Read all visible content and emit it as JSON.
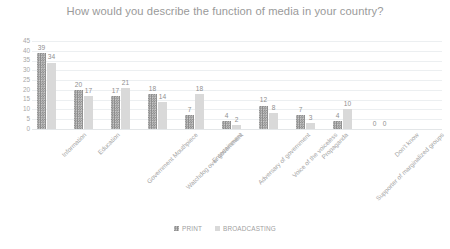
{
  "chart_data": {
    "type": "bar",
    "title": "How would you describe the function of media in your country?",
    "xlabel": "",
    "ylabel": "",
    "ylim": [
      0,
      45
    ],
    "yticks": [
      45,
      40,
      35,
      30,
      25,
      20,
      15,
      10,
      5,
      0
    ],
    "grid": true,
    "legend_position": "bottom",
    "categories": [
      "Information",
      "Education",
      "Government Mouthpiece",
      "Watchdog over government",
      "Entertainment",
      "Adversary of government",
      "Voice of the voiceless",
      "Propaganda",
      "Supporter of marginalized groups",
      "Don't know"
    ],
    "series": [
      {
        "name": "PRINT",
        "color": "#9d9d9d",
        "values": [
          39,
          20,
          17,
          18,
          7,
          4,
          12,
          7,
          4,
          0
        ]
      },
      {
        "name": "BROADCASTING",
        "color": "#d9d9d9",
        "values": [
          34,
          17,
          21,
          14,
          18,
          2,
          8,
          3,
          10,
          0
        ]
      }
    ]
  },
  "legend": {
    "items": [
      {
        "label": "PRINT",
        "swatch": "print"
      },
      {
        "label": "BROADCASTING",
        "swatch": "broadcast"
      }
    ]
  }
}
